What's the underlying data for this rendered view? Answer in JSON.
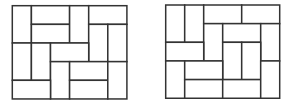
{
  "diagram": {
    "type": "domino-tiling",
    "background": "#ffffff",
    "line_color": "#333333",
    "grid": {
      "cols": 6,
      "rows": 5
    },
    "figures": [
      {
        "name": "tiling-left",
        "origin": [
          12.3,
          5.7
        ],
        "cell": [
          19.1,
          18.65
        ],
        "tiles": [
          {
            "col": 0,
            "row": 0,
            "w": 1,
            "h": 2
          },
          {
            "col": 1,
            "row": 0,
            "w": 2,
            "h": 1
          },
          {
            "col": 1,
            "row": 1,
            "w": 2,
            "h": 1
          },
          {
            "col": 3,
            "row": 0,
            "w": 1,
            "h": 2
          },
          {
            "col": 4,
            "row": 0,
            "w": 2,
            "h": 1
          },
          {
            "col": 4,
            "row": 1,
            "w": 1,
            "h": 2
          },
          {
            "col": 5,
            "row": 1,
            "w": 1,
            "h": 2
          },
          {
            "col": 0,
            "row": 2,
            "w": 1,
            "h": 2
          },
          {
            "col": 1,
            "row": 2,
            "w": 1,
            "h": 2
          },
          {
            "col": 2,
            "row": 2,
            "w": 2,
            "h": 1
          },
          {
            "col": 2,
            "row": 3,
            "w": 1,
            "h": 2
          },
          {
            "col": 3,
            "row": 3,
            "w": 2,
            "h": 1
          },
          {
            "col": 3,
            "row": 4,
            "w": 2,
            "h": 1
          },
          {
            "col": 5,
            "row": 3,
            "w": 1,
            "h": 2
          },
          {
            "col": 0,
            "row": 4,
            "w": 2,
            "h": 1
          }
        ]
      },
      {
        "name": "tiling-right",
        "origin": [
          165.7,
          5.0
        ],
        "cell": [
          19.0,
          18.65
        ],
        "tiles": [
          {
            "col": 0,
            "row": 0,
            "w": 1,
            "h": 2
          },
          {
            "col": 1,
            "row": 0,
            "w": 1,
            "h": 2
          },
          {
            "col": 2,
            "row": 0,
            "w": 2,
            "h": 1
          },
          {
            "col": 4,
            "row": 0,
            "w": 2,
            "h": 1
          },
          {
            "col": 2,
            "row": 1,
            "w": 1,
            "h": 2
          },
          {
            "col": 3,
            "row": 1,
            "w": 2,
            "h": 1
          },
          {
            "col": 5,
            "row": 1,
            "w": 1,
            "h": 2
          },
          {
            "col": 0,
            "row": 2,
            "w": 2,
            "h": 1
          },
          {
            "col": 3,
            "row": 2,
            "w": 1,
            "h": 2
          },
          {
            "col": 4,
            "row": 2,
            "w": 1,
            "h": 2
          },
          {
            "col": 0,
            "row": 3,
            "w": 1,
            "h": 2
          },
          {
            "col": 1,
            "row": 3,
            "w": 2,
            "h": 1
          },
          {
            "col": 1,
            "row": 4,
            "w": 2,
            "h": 1
          },
          {
            "col": 3,
            "row": 4,
            "w": 2,
            "h": 1
          },
          {
            "col": 5,
            "row": 3,
            "w": 1,
            "h": 2
          }
        ]
      }
    ]
  }
}
